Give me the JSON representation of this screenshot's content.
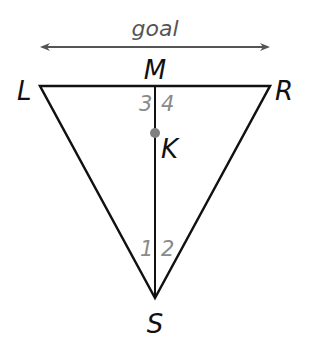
{
  "diagram": {
    "title": "goal",
    "points": {
      "L": {
        "label": "L",
        "x": 40,
        "y": 86
      },
      "R": {
        "label": "R",
        "x": 270,
        "y": 86
      },
      "M": {
        "label": "M",
        "x": 155,
        "y": 86
      },
      "K": {
        "label": "K",
        "x": 155,
        "y": 133
      },
      "S": {
        "label": "S",
        "x": 155,
        "y": 298
      }
    },
    "angles": [
      {
        "label": "1",
        "at": "S",
        "side": "left"
      },
      {
        "label": "2",
        "at": "S",
        "side": "right"
      },
      {
        "label": "3",
        "at": "M",
        "side": "left"
      },
      {
        "label": "4",
        "at": "M",
        "side": "right"
      }
    ],
    "arrow": {
      "from_x": 40,
      "to_x": 270,
      "y": 47,
      "color": "#555555"
    },
    "colors": {
      "lines": "#111111",
      "angle_labels": "#8a8a8a",
      "point_K": "#808080"
    }
  }
}
